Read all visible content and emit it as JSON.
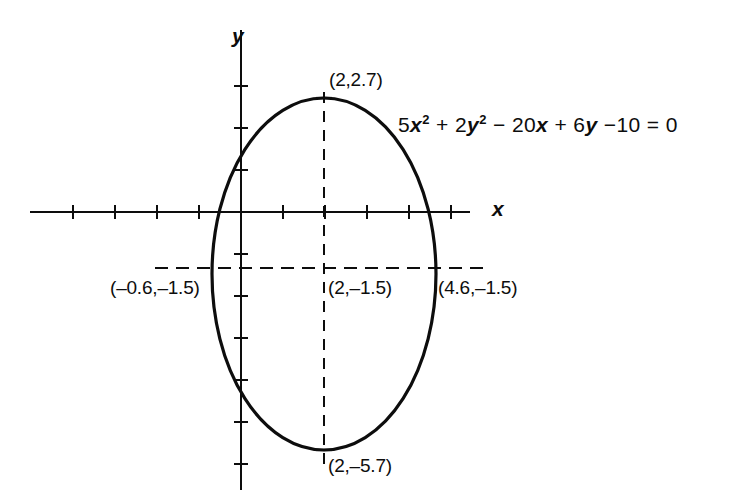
{
  "figure": {
    "background_color": "#ffffff",
    "ink_color": "#0d0d0d",
    "width": 749,
    "height": 501
  },
  "axes": {
    "x_label": "x",
    "y_label": "y",
    "origin_px": {
      "x": 241,
      "y": 212
    },
    "unit_px": 42,
    "x_axis_from_px": 30,
    "x_axis_to_px": 470,
    "y_axis_from_px": 30,
    "y_axis_to_px": 490,
    "x_tick_count": 11,
    "y_tick_count": 11
  },
  "equation": {
    "full_text": "5x^2 + 2y^2 - 20x + 6y - 10 = 0",
    "parts": [
      {
        "text": "5",
        "style": "normal"
      },
      {
        "text": "x",
        "style": "italic"
      },
      {
        "text": "2",
        "style": "superscript"
      },
      {
        "text": " + 2",
        "style": "normal"
      },
      {
        "text": "y",
        "style": "italic"
      },
      {
        "text": "2",
        "style": "superscript"
      },
      {
        "text": " − 20",
        "style": "normal"
      },
      {
        "text": "x",
        "style": "italic"
      },
      {
        "text": " + 6",
        "style": "normal"
      },
      {
        "text": "y",
        "style": "italic"
      },
      {
        "text": " −10 = 0",
        "style": "normal"
      }
    ]
  },
  "labels": {
    "top_vertex": "(2,2.7)",
    "center": "(2,–1.5)",
    "left_vertex": "(–0.6,–1.5)",
    "right_vertex": "(4.6,–1.5)",
    "bottom_vertex": "(2,–5.7)"
  },
  "chart_data": {
    "type": "scatter",
    "title": "",
    "xlabel": "x",
    "ylabel": "y",
    "grid": false,
    "legend": null,
    "xlim": [
      -5,
      5.5
    ],
    "ylim": [
      -7,
      4.5
    ],
    "curves": [
      {
        "name": "ellipse",
        "equation": "5x^2 + 2y^2 - 20x + 6y - 10 = 0",
        "shape": "ellipse",
        "center": [
          2,
          -1.5
        ],
        "semi_axis_x": 2.6,
        "semi_axis_y": 4.2,
        "line_style": "solid",
        "line_width": 3
      }
    ],
    "annotations": [
      {
        "label": "(2,2.7)",
        "point": [
          2,
          2.7
        ],
        "role": "top-vertex"
      },
      {
        "label": "(2,–1.5)",
        "point": [
          2,
          -1.5
        ],
        "role": "center"
      },
      {
        "label": "(–0.6,–1.5)",
        "point": [
          -0.6,
          -1.5
        ],
        "role": "left-vertex"
      },
      {
        "label": "(4.6,–1.5)",
        "point": [
          4.6,
          -1.5
        ],
        "role": "right-vertex"
      },
      {
        "label": "(2,–5.7)",
        "point": [
          2,
          -5.7
        ],
        "role": "bottom-vertex"
      }
    ],
    "guide_lines": [
      {
        "orientation": "vertical",
        "at_x": 2,
        "from_y": 2.7,
        "to_y": -5.7,
        "style": "dashed"
      },
      {
        "orientation": "horizontal",
        "at_y": -1.5,
        "from_x": -2.05,
        "to_x": 5.9,
        "style": "dashed"
      }
    ]
  }
}
